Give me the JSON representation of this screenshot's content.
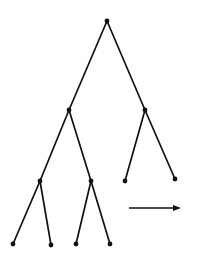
{
  "diagram": {
    "type": "binary-tree",
    "colors": {
      "background": "#ffffff",
      "ink": "#111111"
    },
    "nodes": [
      {
        "id": "root",
        "x": 107,
        "y": 21
      },
      {
        "id": "l",
        "x": 69,
        "y": 110
      },
      {
        "id": "r",
        "x": 145,
        "y": 110
      },
      {
        "id": "ll",
        "x": 40,
        "y": 181
      },
      {
        "id": "lr",
        "x": 91,
        "y": 181
      },
      {
        "id": "rl",
        "x": 125,
        "y": 181
      },
      {
        "id": "rr",
        "x": 175,
        "y": 179
      },
      {
        "id": "lll",
        "x": 13,
        "y": 244
      },
      {
        "id": "llr",
        "x": 51,
        "y": 245
      },
      {
        "id": "lrl",
        "x": 76,
        "y": 244
      },
      {
        "id": "lrr",
        "x": 110,
        "y": 244
      }
    ],
    "edges": [
      [
        "root",
        "l"
      ],
      [
        "root",
        "r"
      ],
      [
        "l",
        "ll"
      ],
      [
        "l",
        "lr"
      ],
      [
        "r",
        "rl"
      ],
      [
        "r",
        "rr"
      ],
      [
        "ll",
        "lll"
      ],
      [
        "ll",
        "llr"
      ],
      [
        "lr",
        "lrl"
      ],
      [
        "lr",
        "lrr"
      ]
    ],
    "arrow": {
      "x1": 129,
      "y1": 208,
      "x2": 181,
      "y2": 208,
      "direction": "right"
    }
  }
}
